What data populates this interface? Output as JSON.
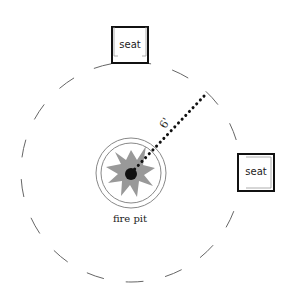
{
  "diagram": {
    "seats": [
      {
        "label": "seat",
        "position": "top"
      },
      {
        "label": "seat",
        "position": "right"
      }
    ],
    "fire_pit": {
      "label": "fire pit"
    },
    "distance": {
      "label": "6'"
    },
    "colors": {
      "line": "#111111",
      "flame": "#999999",
      "ring": "#888888",
      "dash": "#666666"
    }
  }
}
